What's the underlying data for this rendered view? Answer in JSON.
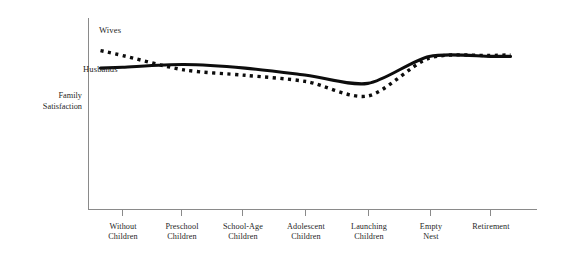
{
  "chart_data": {
    "type": "line",
    "title": "",
    "xlabel": "",
    "ylabel": "Family\nSatisfaction",
    "grid": false,
    "legend_position": "inline-annotation",
    "categories": [
      "Without\nChildren",
      "Preschool\nChildren",
      "School-Age\nChildren",
      "Adolescent\nChildren",
      "Launching\nChildren",
      "Empty\nNest",
      "Retirement"
    ],
    "ylim": [
      0,
      100
    ],
    "y_axis_ticks_shown": false,
    "series": [
      {
        "name": "Husbands",
        "style": "solid",
        "color": "#0d0d0d",
        "values": [
          72,
          75,
          71,
          63,
          54,
          84,
          84
        ]
      },
      {
        "name": "Wives",
        "style": "dotted",
        "color": "#0d0d0d",
        "values": [
          85,
          69,
          63,
          56,
          40,
          82,
          85
        ]
      }
    ],
    "annotations": [
      {
        "text": "Wives",
        "series": "Wives"
      },
      {
        "text": "Husbands",
        "series": "Husbands"
      }
    ]
  },
  "axis": {
    "tick_labels": [
      "Without\nChildren",
      "Preschool\nChildren",
      "School-Age\nChildren",
      "Adolescent\nChildren",
      "Launching\nChildren",
      "Empty\nNest",
      "Retirement"
    ],
    "y_axis_title": "Family\nSatisfaction"
  },
  "legend": {
    "wives_label": "Wives",
    "husbands_label": "Husbands"
  },
  "colors": {
    "line": "#0d0d0d",
    "axis": "#8a8a8a",
    "background": "#ffffff"
  }
}
